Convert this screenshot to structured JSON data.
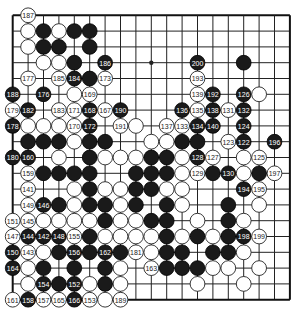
{
  "board": {
    "size": 19,
    "origin_x": 12.7,
    "origin_y": 15.3,
    "spacing_x": 15.4,
    "spacing_y": 15.8,
    "stone_radius": 7.4,
    "colors": {
      "black": "#1a1a1a",
      "white": "#ffffff",
      "lines": "#222222",
      "background": "#ffffff"
    },
    "star_points": [
      [
        9,
        3
      ]
    ]
  },
  "stones": [
    {
      "color": "white",
      "col": 1,
      "row": 0,
      "label": "187"
    },
    {
      "color": "white",
      "col": 1,
      "row": 1,
      "label": ""
    },
    {
      "color": "black",
      "col": 2,
      "row": 1,
      "label": ""
    },
    {
      "color": "white",
      "col": 3,
      "row": 1,
      "label": ""
    },
    {
      "color": "black",
      "col": 4,
      "row": 1,
      "label": ""
    },
    {
      "color": "black",
      "col": 5,
      "row": 1,
      "label": ""
    },
    {
      "color": "white",
      "col": 1,
      "row": 2,
      "label": ""
    },
    {
      "color": "black",
      "col": 2,
      "row": 2,
      "label": ""
    },
    {
      "color": "black",
      "col": 3,
      "row": 2,
      "label": ""
    },
    {
      "color": "black",
      "col": 5,
      "row": 2,
      "label": ""
    },
    {
      "color": "white",
      "col": 2,
      "row": 3,
      "label": ""
    },
    {
      "color": "white",
      "col": 3,
      "row": 3,
      "label": ""
    },
    {
      "color": "black",
      "col": 4,
      "row": 3,
      "label": ""
    },
    {
      "color": "black",
      "col": 6,
      "row": 3,
      "label": "186"
    },
    {
      "color": "black",
      "col": 12,
      "row": 3,
      "label": "200"
    },
    {
      "color": "black",
      "col": 15,
      "row": 3,
      "label": ""
    },
    {
      "color": "white",
      "col": 1,
      "row": 4,
      "label": "177"
    },
    {
      "color": "white",
      "col": 3,
      "row": 4,
      "label": "185"
    },
    {
      "color": "black",
      "col": 4,
      "row": 4,
      "label": "184"
    },
    {
      "color": "black",
      "col": 5,
      "row": 4,
      "label": ""
    },
    {
      "color": "white",
      "col": 6,
      "row": 4,
      "label": "173"
    },
    {
      "color": "white",
      "col": 12,
      "row": 4,
      "label": "193"
    },
    {
      "color": "black",
      "col": 0,
      "row": 5,
      "label": "188"
    },
    {
      "color": "black",
      "col": 2,
      "row": 5,
      "label": "176"
    },
    {
      "color": "white",
      "col": 4,
      "row": 5,
      "label": ""
    },
    {
      "color": "white",
      "col": 5,
      "row": 5,
      "label": "169"
    },
    {
      "color": "white",
      "col": 12,
      "row": 5,
      "label": "139"
    },
    {
      "color": "black",
      "col": 13,
      "row": 5,
      "label": "192"
    },
    {
      "color": "black",
      "col": 15,
      "row": 5,
      "label": "126"
    },
    {
      "color": "white",
      "col": 16,
      "row": 5,
      "label": ""
    },
    {
      "color": "white",
      "col": 0,
      "row": 6,
      "label": "179"
    },
    {
      "color": "black",
      "col": 1,
      "row": 6,
      "label": "182"
    },
    {
      "color": "white",
      "col": 3,
      "row": 6,
      "label": "183"
    },
    {
      "color": "white",
      "col": 4,
      "row": 6,
      "label": "171"
    },
    {
      "color": "black",
      "col": 5,
      "row": 6,
      "label": "168"
    },
    {
      "color": "white",
      "col": 6,
      "row": 6,
      "label": "167"
    },
    {
      "color": "black",
      "col": 7,
      "row": 6,
      "label": "190"
    },
    {
      "color": "black",
      "col": 11,
      "row": 6,
      "label": "136"
    },
    {
      "color": "white",
      "col": 12,
      "row": 6,
      "label": "135"
    },
    {
      "color": "black",
      "col": 13,
      "row": 6,
      "label": "138"
    },
    {
      "color": "white",
      "col": 14,
      "row": 6,
      "label": "131"
    },
    {
      "color": "black",
      "col": 15,
      "row": 6,
      "label": "132"
    },
    {
      "color": "black",
      "col": 0,
      "row": 7,
      "label": "178"
    },
    {
      "color": "white",
      "col": 1,
      "row": 7,
      "label": ""
    },
    {
      "color": "white",
      "col": 2,
      "row": 7,
      "label": ""
    },
    {
      "color": "white",
      "col": 3,
      "row": 7,
      "label": ""
    },
    {
      "color": "white",
      "col": 4,
      "row": 7,
      "label": "170"
    },
    {
      "color": "black",
      "col": 5,
      "row": 7,
      "label": "172"
    },
    {
      "color": "white",
      "col": 7,
      "row": 7,
      "label": "191"
    },
    {
      "color": "white",
      "col": 8,
      "row": 7,
      "label": ""
    },
    {
      "color": "white",
      "col": 10,
      "row": 7,
      "label": "137"
    },
    {
      "color": "white",
      "col": 11,
      "row": 7,
      "label": "133"
    },
    {
      "color": "black",
      "col": 12,
      "row": 7,
      "label": "134"
    },
    {
      "color": "black",
      "col": 13,
      "row": 7,
      "label": "140"
    },
    {
      "color": "black",
      "col": 15,
      "row": 7,
      "label": "124"
    },
    {
      "color": "black",
      "col": 1,
      "row": 8,
      "label": ""
    },
    {
      "color": "black",
      "col": 2,
      "row": 8,
      "label": ""
    },
    {
      "color": "black",
      "col": 3,
      "row": 8,
      "label": ""
    },
    {
      "color": "white",
      "col": 4,
      "row": 8,
      "label": ""
    },
    {
      "color": "black",
      "col": 5,
      "row": 8,
      "label": ""
    },
    {
      "color": "black",
      "col": 6,
      "row": 8,
      "label": ""
    },
    {
      "color": "white",
      "col": 9,
      "row": 8,
      "label": ""
    },
    {
      "color": "white",
      "col": 10,
      "row": 8,
      "label": ""
    },
    {
      "color": "black",
      "col": 11,
      "row": 8,
      "label": ""
    },
    {
      "color": "black",
      "col": 12,
      "row": 8,
      "label": ""
    },
    {
      "color": "white",
      "col": 14,
      "row": 8,
      "label": "123"
    },
    {
      "color": "black",
      "col": 15,
      "row": 8,
      "label": "122"
    },
    {
      "color": "black",
      "col": 17,
      "row": 8,
      "label": "196"
    },
    {
      "color": "black",
      "col": 0,
      "row": 9,
      "label": "180"
    },
    {
      "color": "black",
      "col": 1,
      "row": 9,
      "label": "160"
    },
    {
      "color": "white",
      "col": 3,
      "row": 9,
      "label": ""
    },
    {
      "color": "black",
      "col": 5,
      "row": 9,
      "label": ""
    },
    {
      "color": "white",
      "col": 6,
      "row": 9,
      "label": ""
    },
    {
      "color": "white",
      "col": 7,
      "row": 9,
      "label": ""
    },
    {
      "color": "white",
      "col": 8,
      "row": 9,
      "label": ""
    },
    {
      "color": "black",
      "col": 9,
      "row": 9,
      "label": ""
    },
    {
      "color": "black",
      "col": 10,
      "row": 9,
      "label": ""
    },
    {
      "color": "white",
      "col": 11,
      "row": 9,
      "label": ""
    },
    {
      "color": "black",
      "col": 12,
      "row": 9,
      "label": "128"
    },
    {
      "color": "white",
      "col": 13,
      "row": 9,
      "label": "127"
    },
    {
      "color": "white",
      "col": 15,
      "row": 9,
      "label": ""
    },
    {
      "color": "white",
      "col": 16,
      "row": 9,
      "label": "125"
    },
    {
      "color": "white",
      "col": 1,
      "row": 10,
      "label": "159"
    },
    {
      "color": "black",
      "col": 2,
      "row": 10,
      "label": ""
    },
    {
      "color": "black",
      "col": 3,
      "row": 10,
      "label": ""
    },
    {
      "color": "black",
      "col": 4,
      "row": 10,
      "label": ""
    },
    {
      "color": "black",
      "col": 5,
      "row": 10,
      "label": ""
    },
    {
      "color": "black",
      "col": 8,
      "row": 10,
      "label": ""
    },
    {
      "color": "black",
      "col": 9,
      "row": 10,
      "label": ""
    },
    {
      "color": "black",
      "col": 10,
      "row": 10,
      "label": ""
    },
    {
      "color": "white",
      "col": 11,
      "row": 10,
      "label": ""
    },
    {
      "color": "white",
      "col": 12,
      "row": 10,
      "label": "129"
    },
    {
      "color": "black",
      "col": 13,
      "row": 10,
      "label": ""
    },
    {
      "color": "black",
      "col": 14,
      "row": 10,
      "label": "130"
    },
    {
      "color": "white",
      "col": 15,
      "row": 10,
      "label": ""
    },
    {
      "color": "black",
      "col": 16,
      "row": 10,
      "label": ""
    },
    {
      "color": "white",
      "col": 17,
      "row": 10,
      "label": "197"
    },
    {
      "color": "white",
      "col": 1,
      "row": 11,
      "label": "141"
    },
    {
      "color": "white",
      "col": 4,
      "row": 11,
      "label": ""
    },
    {
      "color": "black",
      "col": 5,
      "row": 11,
      "label": ""
    },
    {
      "color": "white",
      "col": 6,
      "row": 11,
      "label": ""
    },
    {
      "color": "white",
      "col": 7,
      "row": 11,
      "label": ""
    },
    {
      "color": "black",
      "col": 8,
      "row": 11,
      "label": ""
    },
    {
      "color": "black",
      "col": 9,
      "row": 11,
      "label": ""
    },
    {
      "color": "white",
      "col": 10,
      "row": 11,
      "label": ""
    },
    {
      "color": "white",
      "col": 11,
      "row": 11,
      "label": ""
    },
    {
      "color": "black",
      "col": 15,
      "row": 11,
      "label": "194"
    },
    {
      "color": "white",
      "col": 16,
      "row": 11,
      "label": "195"
    },
    {
      "color": "white",
      "col": 1,
      "row": 12,
      "label": "149"
    },
    {
      "color": "black",
      "col": 2,
      "row": 12,
      "label": "146"
    },
    {
      "color": "black",
      "col": 3,
      "row": 12,
      "label": ""
    },
    {
      "color": "white",
      "col": 4,
      "row": 12,
      "label": ""
    },
    {
      "color": "black",
      "col": 5,
      "row": 12,
      "label": ""
    },
    {
      "color": "black",
      "col": 6,
      "row": 12,
      "label": ""
    },
    {
      "color": "white",
      "col": 7,
      "row": 12,
      "label": ""
    },
    {
      "color": "black",
      "col": 8,
      "row": 12,
      "label": ""
    },
    {
      "color": "black",
      "col": 10,
      "row": 12,
      "label": ""
    },
    {
      "color": "white",
      "col": 11,
      "row": 12,
      "label": ""
    },
    {
      "color": "black",
      "col": 14,
      "row": 12,
      "label": ""
    },
    {
      "color": "white",
      "col": 16,
      "row": 12,
      "label": ""
    },
    {
      "color": "white",
      "col": 0,
      "row": 13,
      "label": "151"
    },
    {
      "color": "white",
      "col": 1,
      "row": 13,
      "label": "145"
    },
    {
      "color": "white",
      "col": 2,
      "row": 13,
      "label": ""
    },
    {
      "color": "white",
      "col": 3,
      "row": 13,
      "label": ""
    },
    {
      "color": "white",
      "col": 4,
      "row": 13,
      "label": ""
    },
    {
      "color": "white",
      "col": 5,
      "row": 13,
      "label": ""
    },
    {
      "color": "black",
      "col": 6,
      "row": 13,
      "label": ""
    },
    {
      "color": "white",
      "col": 7,
      "row": 13,
      "label": ""
    },
    {
      "color": "white",
      "col": 8,
      "row": 13,
      "label": ""
    },
    {
      "color": "black",
      "col": 9,
      "row": 13,
      "label": ""
    },
    {
      "color": "black",
      "col": 10,
      "row": 13,
      "label": ""
    },
    {
      "color": "white",
      "col": 12,
      "row": 13,
      "label": ""
    },
    {
      "color": "black",
      "col": 14,
      "row": 13,
      "label": ""
    },
    {
      "color": "white",
      "col": 15,
      "row": 13,
      "label": ""
    },
    {
      "color": "white",
      "col": 0,
      "row": 14,
      "label": "147"
    },
    {
      "color": "black",
      "col": 1,
      "row": 14,
      "label": "144"
    },
    {
      "color": "black",
      "col": 2,
      "row": 14,
      "label": "142"
    },
    {
      "color": "black",
      "col": 3,
      "row": 14,
      "label": "148"
    },
    {
      "color": "white",
      "col": 4,
      "row": 14,
      "label": "155"
    },
    {
      "color": "black",
      "col": 5,
      "row": 14,
      "label": ""
    },
    {
      "color": "white",
      "col": 6,
      "row": 14,
      "label": ""
    },
    {
      "color": "white",
      "col": 7,
      "row": 14,
      "label": ""
    },
    {
      "color": "white",
      "col": 8,
      "row": 14,
      "label": ""
    },
    {
      "color": "white",
      "col": 9,
      "row": 14,
      "label": ""
    },
    {
      "color": "black",
      "col": 10,
      "row": 14,
      "label": ""
    },
    {
      "color": "white",
      "col": 11,
      "row": 14,
      "label": ""
    },
    {
      "color": "black",
      "col": 12,
      "row": 14,
      "label": ""
    },
    {
      "color": "white",
      "col": 13,
      "row": 14,
      "label": ""
    },
    {
      "color": "black",
      "col": 14,
      "row": 14,
      "label": ""
    },
    {
      "color": "black",
      "col": 15,
      "row": 14,
      "label": "198"
    },
    {
      "color": "white",
      "col": 16,
      "row": 14,
      "label": "199"
    },
    {
      "color": "black",
      "col": 0,
      "row": 15,
      "label": "150"
    },
    {
      "color": "white",
      "col": 1,
      "row": 15,
      "label": "143"
    },
    {
      "color": "white",
      "col": 2,
      "row": 15,
      "label": ""
    },
    {
      "color": "black",
      "col": 3,
      "row": 15,
      "label": ""
    },
    {
      "color": "black",
      "col": 4,
      "row": 15,
      "label": "156"
    },
    {
      "color": "black",
      "col": 5,
      "row": 15,
      "label": ""
    },
    {
      "color": "black",
      "col": 6,
      "row": 15,
      "label": "162"
    },
    {
      "color": "black",
      "col": 7,
      "row": 15,
      "label": ""
    },
    {
      "color": "white",
      "col": 8,
      "row": 15,
      "label": "181"
    },
    {
      "color": "white",
      "col": 9,
      "row": 15,
      "label": ""
    },
    {
      "color": "black",
      "col": 10,
      "row": 15,
      "label": ""
    },
    {
      "color": "black",
      "col": 11,
      "row": 15,
      "label": ""
    },
    {
      "color": "black",
      "col": 13,
      "row": 15,
      "label": ""
    },
    {
      "color": "black",
      "col": 14,
      "row": 15,
      "label": ""
    },
    {
      "color": "white",
      "col": 15,
      "row": 15,
      "label": ""
    },
    {
      "color": "black",
      "col": 0,
      "row": 16,
      "label": "164"
    },
    {
      "color": "white",
      "col": 1,
      "row": 16,
      "label": ""
    },
    {
      "color": "black",
      "col": 2,
      "row": 16,
      "label": ""
    },
    {
      "color": "black",
      "col": 4,
      "row": 16,
      "label": ""
    },
    {
      "color": "black",
      "col": 6,
      "row": 16,
      "label": ""
    },
    {
      "color": "white",
      "col": 7,
      "row": 16,
      "label": ""
    },
    {
      "color": "white",
      "col": 9,
      "row": 16,
      "label": "163"
    },
    {
      "color": "black",
      "col": 10,
      "row": 16,
      "label": ""
    },
    {
      "color": "black",
      "col": 11,
      "row": 16,
      "label": ""
    },
    {
      "color": "black",
      "col": 12,
      "row": 16,
      "label": ""
    },
    {
      "color": "white",
      "col": 13,
      "row": 16,
      "label": ""
    },
    {
      "color": "white",
      "col": 14,
      "row": 16,
      "label": ""
    },
    {
      "color": "white",
      "col": 16,
      "row": 16,
      "label": ""
    },
    {
      "color": "white",
      "col": 1,
      "row": 17,
      "label": ""
    },
    {
      "color": "black",
      "col": 2,
      "row": 17,
      "label": "154"
    },
    {
      "color": "black",
      "col": 3,
      "row": 17,
      "label": ""
    },
    {
      "color": "black",
      "col": 4,
      "row": 17,
      "label": "152"
    },
    {
      "color": "white",
      "col": 5,
      "row": 17,
      "label": ""
    },
    {
      "color": "black",
      "col": 6,
      "row": 17,
      "label": ""
    },
    {
      "color": "white",
      "col": 7,
      "row": 17,
      "label": ""
    },
    {
      "color": "white",
      "col": 12,
      "row": 17,
      "label": ""
    },
    {
      "color": "white",
      "col": 15,
      "row": 17,
      "label": ""
    },
    {
      "color": "white",
      "col": 0,
      "row": 18,
      "label": "161"
    },
    {
      "color": "black",
      "col": 1,
      "row": 18,
      "label": "158"
    },
    {
      "color": "white",
      "col": 2,
      "row": 18,
      "label": "157"
    },
    {
      "color": "white",
      "col": 3,
      "row": 18,
      "label": "165"
    },
    {
      "color": "black",
      "col": 4,
      "row": 18,
      "label": "166"
    },
    {
      "color": "white",
      "col": 5,
      "row": 18,
      "label": "153"
    },
    {
      "color": "white",
      "col": 6,
      "row": 18,
      "label": ""
    },
    {
      "color": "white",
      "col": 7,
      "row": 18,
      "label": "189"
    }
  ]
}
